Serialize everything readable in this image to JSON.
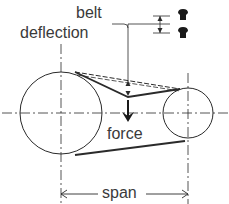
{
  "diagram": {
    "labels": {
      "belt_deflection_line1": "belt",
      "belt_deflection_line2": "deflection",
      "force": "force",
      "span": "span"
    },
    "colors": {
      "line": "#2a2a2a",
      "text": "#3a3a3a",
      "background": "#ffffff"
    },
    "components": {
      "large_pulley": {
        "cx": 61,
        "cy": 113,
        "r": 41
      },
      "small_pulley": {
        "cx": 188,
        "cy": 113,
        "r": 25
      },
      "belt_tight_path": [
        [
          75,
          72
        ],
        [
          128,
          97
        ],
        [
          180,
          89
        ]
      ],
      "belt_straight_dashed": [
        [
          75,
          72
        ],
        [
          180,
          89
        ]
      ],
      "belt_bottom": [
        [
          75,
          155
        ],
        [
          185,
          141
        ]
      ]
    }
  }
}
